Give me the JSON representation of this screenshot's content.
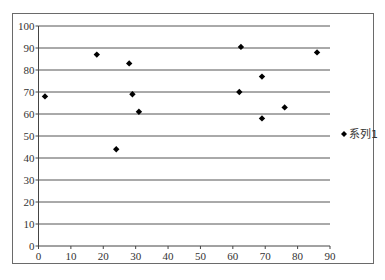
{
  "chart_data": {
    "type": "scatter",
    "title": "",
    "xlabel": "",
    "ylabel": "",
    "xlim": [
      0,
      90
    ],
    "ylim": [
      0,
      100
    ],
    "x_ticks": [
      0,
      10,
      20,
      30,
      40,
      50,
      60,
      70,
      80,
      90
    ],
    "y_ticks": [
      0,
      10,
      20,
      30,
      40,
      50,
      60,
      70,
      80,
      90,
      100
    ],
    "grid": {
      "horizontal": true,
      "vertical": false
    },
    "legend": {
      "position": "right",
      "entries": [
        "系列1"
      ]
    },
    "marker": "diamond",
    "series": [
      {
        "name": "系列1",
        "color": "#000000",
        "points": [
          {
            "x": 2,
            "y": 68
          },
          {
            "x": 18,
            "y": 87
          },
          {
            "x": 24,
            "y": 44
          },
          {
            "x": 28,
            "y": 83
          },
          {
            "x": 29,
            "y": 69
          },
          {
            "x": 31,
            "y": 61
          },
          {
            "x": 62,
            "y": 70
          },
          {
            "x": 62.5,
            "y": 90.5
          },
          {
            "x": 69,
            "y": 77
          },
          {
            "x": 69,
            "y": 58
          },
          {
            "x": 76,
            "y": 63
          },
          {
            "x": 86,
            "y": 88
          }
        ]
      }
    ]
  },
  "colors": {
    "gridline": "#555555",
    "axis": "#444444",
    "frame": "#6a6a6a",
    "marker": "#000000"
  }
}
